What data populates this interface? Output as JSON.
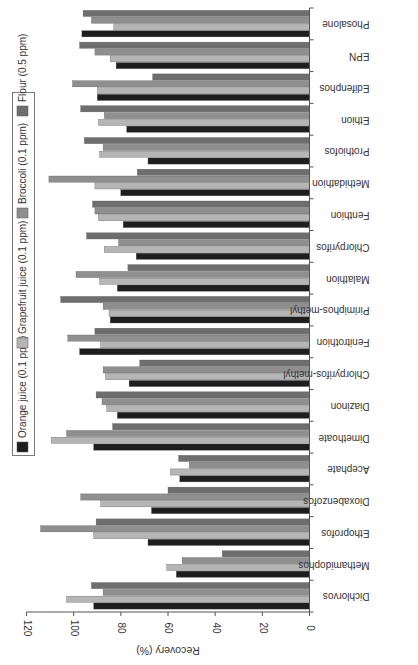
{
  "chart_data": {
    "type": "bar",
    "orientation": "horizontal-rotated",
    "title": "",
    "xlabel": "",
    "ylabel": "Recovery (%)",
    "ylim": [
      0,
      120
    ],
    "yticks": [
      0,
      20,
      40,
      60,
      80,
      100,
      120
    ],
    "grid": false,
    "legend_position": "top",
    "categories": [
      "Dichlorvos",
      "Methamidophos",
      "Ethoprofos",
      "Dioxabenzofos",
      "Acephate",
      "Dimethoate",
      "Diazinon",
      "Chlorpyrifos-methyl",
      "Fenitrothion",
      "Pirimiphos-methyl",
      "Malathion",
      "Chlorpyrifos",
      "Fenthion",
      "Methidathion",
      "Prothiofos",
      "Ethion",
      "Edifenphos",
      "EPN",
      "Phosalone"
    ],
    "series": [
      {
        "name": "Orange juice (0.1 ppm)",
        "color": "#1e1e1e",
        "values": [
          91.5,
          56.5,
          68.5,
          67,
          55,
          91.5,
          81.5,
          76.5,
          97.5,
          84.5,
          81.5,
          73.5,
          79,
          80,
          68.5,
          77.5,
          90,
          82,
          96.5
        ]
      },
      {
        "name": "Grapefruit juice (0.1 ppm)",
        "color": "#b5b5b5",
        "values": [
          103,
          60.5,
          91.5,
          88.5,
          59,
          109.5,
          86,
          86.5,
          88.5,
          85,
          89,
          87,
          89.5,
          91,
          89,
          89.5,
          90,
          84.5,
          83
        ]
      },
      {
        "name": "Broccoli (0.1 ppm)",
        "color": "#8f8f8f",
        "values": [
          87.5,
          54,
          114,
          97,
          51,
          103,
          88,
          87.5,
          102.5,
          87.5,
          99,
          81,
          91,
          110.5,
          87.5,
          87,
          100.5,
          91,
          92.5
        ]
      },
      {
        "name": "Flour (0.5 ppm)",
        "color": "#6e6e6e",
        "values": [
          92.5,
          37,
          90.5,
          60,
          55.5,
          83.5,
          90.5,
          72,
          91,
          105.5,
          77,
          94.5,
          92,
          73,
          95.5,
          97,
          66.5,
          97.5,
          96
        ]
      }
    ]
  }
}
